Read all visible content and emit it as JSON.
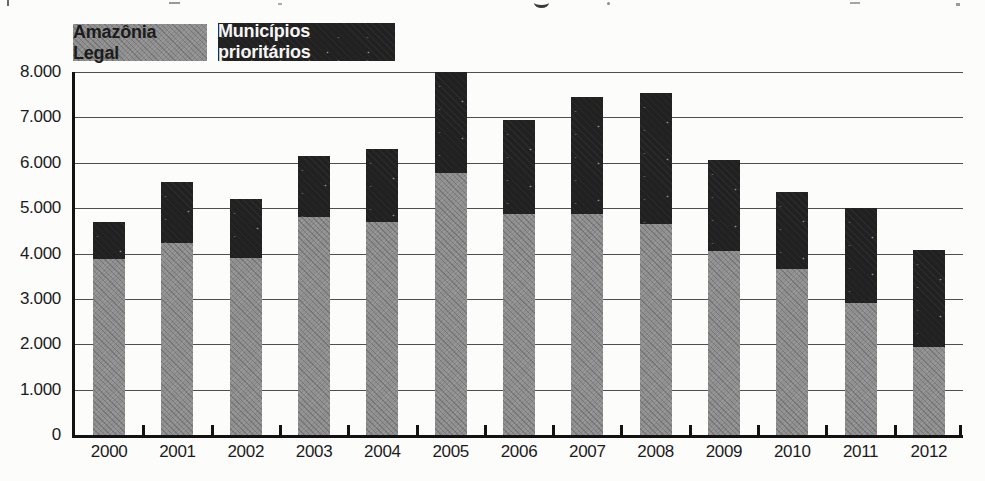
{
  "legend": [
    {
      "label": "Amazônia Legal",
      "color": "#8d8d8d",
      "text_color": "#1c1c1c"
    },
    {
      "label": "Municípios prioritários",
      "color": "#212121",
      "text_color": "#f5f5f5"
    }
  ],
  "chart_data": {
    "type": "bar",
    "stacked": true,
    "categories": [
      "2000",
      "2001",
      "2002",
      "2003",
      "2004",
      "2005",
      "2006",
      "2007",
      "2008",
      "2009",
      "2010",
      "2011",
      "2012"
    ],
    "series": [
      {
        "name": "Amazônia Legal",
        "color": "#8d8d8d",
        "values": [
          3870,
          4230,
          3900,
          4800,
          4700,
          5780,
          4870,
          4870,
          4650,
          4050,
          3650,
          2900,
          1950
        ]
      },
      {
        "name": "Municípios prioritários",
        "color": "#212121",
        "values": [
          830,
          1340,
          1300,
          1350,
          1600,
          2220,
          2080,
          2580,
          2880,
          2000,
          1700,
          2100,
          2130
        ]
      }
    ],
    "totals": [
      4700,
      5570,
      5200,
      6150,
      6300,
      8000,
      6950,
      7450,
      7530,
      6050,
      5350,
      5000,
      4080
    ],
    "ylim": [
      0,
      8000
    ],
    "y_ticks": [
      {
        "value": 8000,
        "label": "8.000"
      },
      {
        "value": 7000,
        "label": "7.000"
      },
      {
        "value": 6000,
        "label": "6.000"
      },
      {
        "value": 5000,
        "label": "5.000"
      },
      {
        "value": 4000,
        "label": "4.000"
      },
      {
        "value": 3000,
        "label": "3.000"
      },
      {
        "value": 2000,
        "label": "2.000"
      },
      {
        "value": 1000,
        "label": "1.000"
      },
      {
        "value": 0,
        "label": "0"
      }
    ],
    "grid": "horizontal",
    "legend_position": "top-left"
  }
}
